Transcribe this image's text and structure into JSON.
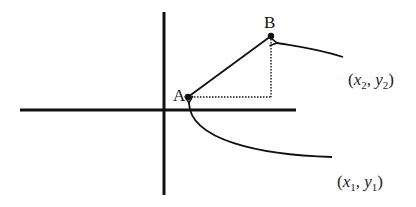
{
  "diagram": {
    "type": "coordinate-plane-two-points",
    "axes": {
      "horizontal": {
        "x1": 20,
        "x2": 296,
        "y": 110
      },
      "vertical": {
        "x": 164,
        "y1": 12,
        "y2": 195
      }
    },
    "points": [
      {
        "id": "A",
        "label": "A",
        "x": 188,
        "y": 97
      },
      {
        "id": "B",
        "label": "B",
        "x": 271,
        "y": 36
      }
    ],
    "segment": {
      "from": "A",
      "to": "B",
      "style": "solid"
    },
    "guides": [
      {
        "from": "A",
        "to": "corner",
        "style": "dotted"
      },
      {
        "from": "corner",
        "to": "B",
        "style": "dotted"
      }
    ],
    "annotations": [
      {
        "id": "point-b-coords",
        "points_to": "B",
        "text": "(x2, y2)",
        "var_x": "x",
        "sub_x": "2",
        "var_y": "y",
        "sub_y": "2"
      },
      {
        "id": "point-a-coords",
        "points_to": "A",
        "text": "(x1, y1)",
        "var_x": "x",
        "sub_x": "1",
        "var_y": "y",
        "sub_y": "1"
      }
    ],
    "colors": {
      "ink": "#111111",
      "background": "#ffffff"
    }
  }
}
